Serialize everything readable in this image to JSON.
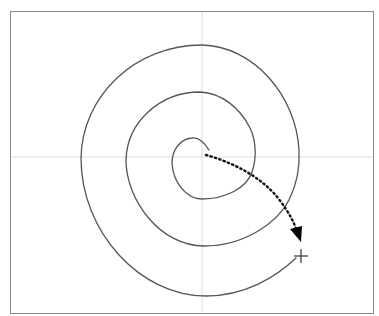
{
  "diagram": {
    "type": "spiral-drag-gesture",
    "colors": {
      "background": "#ffffff",
      "frame": "#8a8a8a",
      "axis": "#dddddd",
      "spiral": "#555555",
      "drag_path": "#111111",
      "arrowhead": "#000000",
      "end_marker": "#333333"
    },
    "frame": {
      "x": 10,
      "y": 11,
      "width": 364,
      "height": 303
    },
    "axes": {
      "center_x": 202,
      "center_y": 157
    },
    "spiral": {
      "start": [
        209,
        150
      ],
      "end": [
        296,
        258
      ],
      "turns": 2.5
    },
    "drag_path": {
      "style": "dotted",
      "start": [
        206,
        155
      ],
      "end": [
        298,
        238
      ],
      "direction": "center-to-outer"
    },
    "end_marker": {
      "shape": "crosshair",
      "x": 301,
      "y": 256,
      "size": 7
    }
  }
}
